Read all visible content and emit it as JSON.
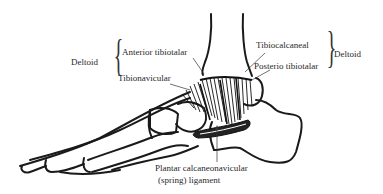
{
  "diagram": {
    "labels": {
      "deltoid_left": "Deltoid",
      "anterior_tibiotalar": "Anterior tibiotalar",
      "tibionavicular": "Tibionavicular",
      "tibiocalcaneal": "Tibiocalcaneal",
      "posterio_tibiotalar": "Posterio tibiotalar",
      "deltoid_right": "Deltoid",
      "plantar_line1": "Plantar calcaneonavicular",
      "plantar_line2": "(spring) ligament"
    },
    "colors": {
      "line": "#1a1a1a",
      "text": "#2a2a2a",
      "background": "#ffffff"
    }
  }
}
